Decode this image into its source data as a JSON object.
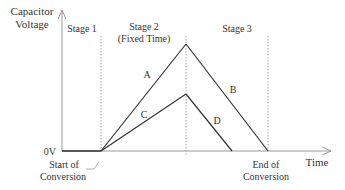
{
  "diagram": {
    "type": "dual-slope integration waveform",
    "y_axis_label_line1": "Capacitor",
    "y_axis_label_line2": "Voltage",
    "x_axis_label": "Time",
    "zero_label": "0V",
    "stages": [
      {
        "label_line1": "Stage 1",
        "label_line2": ""
      },
      {
        "label_line1": "Stage 2",
        "label_line2": "(Fixed Time)"
      },
      {
        "label_line1": "Stage 3",
        "label_line2": ""
      }
    ],
    "start_label_line1": "Start of",
    "start_label_line2": "Conversion",
    "end_label_line1": "End of",
    "end_label_line2": "Conversion",
    "segments": [
      {
        "id": "A",
        "label": "A",
        "description": "integration ramp (larger input)"
      },
      {
        "id": "B",
        "label": "B",
        "description": "de-integration ramp (larger input)"
      },
      {
        "id": "C",
        "label": "C",
        "description": "integration ramp (smaller input)"
      },
      {
        "id": "D",
        "label": "D",
        "description": "de-integration ramp (smaller input)"
      }
    ],
    "colors": {
      "line": "#333333",
      "axis": "#999999",
      "dashed": "#aaaaaa"
    }
  }
}
